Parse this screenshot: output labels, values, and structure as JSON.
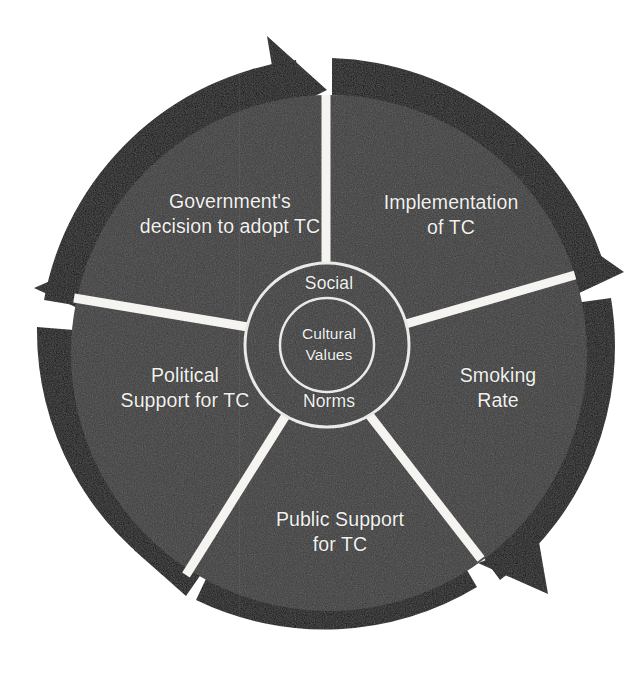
{
  "figure": {
    "type": "cyclic-process-wheel",
    "segment_count": 5,
    "rotation_direction": "clockwise",
    "background_color": "#ffffff",
    "disc_color": "#3a3a3a",
    "ring_color": "#0d0d0d",
    "spoke_color": "#f5f4f0",
    "text_color": "#f2f2f0"
  },
  "center": {
    "outer_ring_top_label": "Social",
    "outer_ring_bottom_label": "Norms",
    "inner_circle_label": "Cultural\nValues"
  },
  "sectors": [
    {
      "id": "government",
      "label": "Government's\ndecision to adopt TC",
      "position": "top-left"
    },
    {
      "id": "implementation",
      "label": "Implementation\nof TC",
      "position": "top-right"
    },
    {
      "id": "smoking-rate",
      "label": "Smoking\nRate",
      "position": "right"
    },
    {
      "id": "public-support",
      "label": "Public Support\nfor TC",
      "position": "bottom"
    },
    {
      "id": "political-support",
      "label": "Political\nSupport for TC",
      "position": "left"
    }
  ],
  "arrows": [
    {
      "id": "arrow-top",
      "points_to": "implementation"
    },
    {
      "id": "arrow-upper-right",
      "points_to": "smoking-rate"
    },
    {
      "id": "arrow-lower-right",
      "points_to": "public-support"
    },
    {
      "id": "arrow-lower-left",
      "points_to": "political-support"
    },
    {
      "id": "arrow-upper-left",
      "points_to": "government"
    }
  ]
}
